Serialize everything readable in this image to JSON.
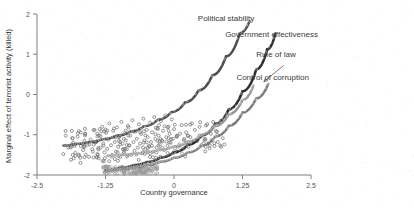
{
  "chart_data": {
    "type": "scatter",
    "title": "",
    "subtitle": "",
    "xlabel": "Country governance",
    "ylabel": "Marginal effect of terrorist activity (killed)",
    "xlim": [
      -2.5,
      2.5
    ],
    "ylim": [
      -2,
      2
    ],
    "xticks": [
      -2.5,
      -1.25,
      0,
      1.25,
      2.5
    ],
    "xticklabels": [
      "-2.5",
      "-1.25",
      "0",
      "1.25",
      "2.5"
    ],
    "yticks": [
      -2,
      -1,
      0,
      1,
      2
    ],
    "yticklabels": [
      "-2",
      "-1",
      "0",
      "1",
      "2"
    ],
    "grid": false,
    "legend_position": "annotations-right",
    "annotations": [
      {
        "text": "Political stability",
        "x": 0.95,
        "y": 1.82,
        "color": "#3a3a3a"
      },
      {
        "text": "Government effectiveness",
        "x": 1.78,
        "y": 1.42,
        "color": "#3a3a3a"
      },
      {
        "text": "Rule of law",
        "x": 1.86,
        "y": 0.92,
        "color": "#3a3a3a"
      },
      {
        "text": "Control of corruption",
        "x": 1.8,
        "y": 0.36,
        "color": "#3a3a3a"
      }
    ],
    "arrows": [
      {
        "from_x": 2.0,
        "from_y": 0.72,
        "to_x": 1.64,
        "to_y": 0.32
      }
    ],
    "series": [
      {
        "name": "Political stability",
        "type": "line",
        "color": "#404040",
        "marker": "circle-open",
        "x": [
          -2.02,
          -1.8,
          -1.55,
          -1.3,
          -1.05,
          -0.8,
          -0.55,
          -0.3,
          -0.05,
          0.2,
          0.45,
          0.7,
          0.95,
          1.2,
          1.38
        ],
        "y": [
          -1.27,
          -1.23,
          -1.18,
          -1.11,
          -1.02,
          -0.92,
          -0.79,
          -0.63,
          -0.44,
          -0.2,
          0.1,
          0.48,
          0.95,
          1.52,
          1.82
        ]
      },
      {
        "name": "Government effectiveness",
        "type": "line",
        "color": "#1c1c1c",
        "marker": "circle-open",
        "x": [
          -1.25,
          -1.0,
          -0.75,
          -0.5,
          -0.25,
          0.0,
          0.25,
          0.5,
          0.75,
          1.0,
          1.25,
          1.5,
          1.7,
          1.85
        ],
        "y": [
          -1.88,
          -1.83,
          -1.76,
          -1.68,
          -1.57,
          -1.43,
          -1.25,
          -1.02,
          -0.73,
          -0.37,
          0.08,
          0.62,
          1.12,
          1.52
        ]
      },
      {
        "name": "Rule of law",
        "type": "line",
        "color": "#8c8c8c",
        "marker": "circle-open",
        "x": [
          -1.22,
          -1.0,
          -0.75,
          -0.5,
          -0.25,
          0.0,
          0.25,
          0.5,
          0.75,
          1.0,
          1.25,
          1.45
        ],
        "y": [
          -1.52,
          -1.5,
          -1.47,
          -1.43,
          -1.37,
          -1.29,
          -1.17,
          -1.0,
          -0.78,
          -0.49,
          -0.14,
          0.22
        ]
      },
      {
        "name": "Control of corruption",
        "type": "line",
        "color": "#6e6e6e",
        "marker": "circle-open",
        "x": [
          -1.22,
          -1.0,
          -0.75,
          -0.5,
          -0.25,
          0.0,
          0.25,
          0.5,
          0.75,
          1.0,
          1.25,
          1.5,
          1.72
        ],
        "y": [
          -1.88,
          -1.85,
          -1.81,
          -1.75,
          -1.67,
          -1.57,
          -1.44,
          -1.27,
          -1.05,
          -0.78,
          -0.45,
          -0.1,
          0.26
        ]
      }
    ],
    "scatter": {
      "name": "observations",
      "marker": "circle-open",
      "color": "#6b6b6b",
      "n_points": 260,
      "x_range": [
        -2.05,
        0.95
      ],
      "y_range": [
        -1.95,
        -0.35
      ],
      "points": [
        [
          -2.02,
          -1.48
        ],
        [
          -1.93,
          -1.32
        ],
        [
          -1.88,
          -1.62
        ],
        [
          -1.84,
          -1.2
        ],
        [
          -1.8,
          -1.45
        ],
        [
          -1.76,
          -1.05
        ],
        [
          -1.73,
          -1.52
        ],
        [
          -1.7,
          -1.28
        ],
        [
          -1.66,
          -1.38
        ],
        [
          -1.62,
          -0.98
        ],
        [
          -1.58,
          -1.25
        ],
        [
          -1.55,
          -1.55
        ],
        [
          -1.52,
          -1.12
        ],
        [
          -1.48,
          -1.42
        ],
        [
          -1.45,
          -0.88
        ],
        [
          -1.42,
          -1.18
        ],
        [
          -1.4,
          -1.48
        ],
        [
          -1.37,
          -1.02
        ],
        [
          -1.34,
          -1.32
        ],
        [
          -1.31,
          -0.8
        ],
        [
          -1.29,
          -1.22
        ],
        [
          -1.26,
          -1.58
        ],
        [
          -1.24,
          -0.95
        ],
        [
          -1.22,
          -1.35
        ],
        [
          -1.2,
          -1.12
        ],
        [
          -1.18,
          -0.72
        ],
        [
          -1.15,
          -1.26
        ],
        [
          -1.13,
          -1.5
        ],
        [
          -1.11,
          -0.9
        ],
        [
          -1.08,
          -1.18
        ],
        [
          -1.06,
          -1.42
        ],
        [
          -1.04,
          -0.82
        ],
        [
          -1.02,
          -1.3
        ],
        [
          -1.0,
          -1.05
        ],
        [
          -0.98,
          -1.55
        ],
        [
          -0.96,
          -0.68
        ],
        [
          -0.94,
          -1.22
        ],
        [
          -0.92,
          -1.46
        ],
        [
          -0.9,
          -0.96
        ],
        [
          -0.88,
          -1.14
        ],
        [
          -0.86,
          -1.36
        ],
        [
          -0.84,
          -0.78
        ],
        [
          -0.82,
          -1.26
        ],
        [
          -0.8,
          -1.02
        ],
        [
          -0.78,
          -1.5
        ],
        [
          -0.76,
          -0.64
        ],
        [
          -0.74,
          -1.18
        ],
        [
          -0.72,
          -1.4
        ],
        [
          -0.7,
          -0.92
        ],
        [
          -0.68,
          -1.1
        ],
        [
          -0.66,
          -1.32
        ],
        [
          -0.64,
          -0.74
        ],
        [
          -0.62,
          -1.22
        ],
        [
          -0.6,
          -0.98
        ],
        [
          -0.58,
          -1.46
        ],
        [
          -0.56,
          -0.6
        ],
        [
          -0.54,
          -1.14
        ],
        [
          -0.52,
          -1.36
        ],
        [
          -0.5,
          -0.88
        ],
        [
          -0.48,
          -1.06
        ],
        [
          -0.46,
          -1.28
        ],
        [
          -0.44,
          -0.7
        ],
        [
          -0.42,
          -1.18
        ],
        [
          -0.4,
          -0.94
        ],
        [
          -0.38,
          -1.42
        ],
        [
          -0.36,
          -0.56
        ],
        [
          -0.34,
          -1.1
        ],
        [
          -0.32,
          -1.32
        ],
        [
          -0.3,
          -0.84
        ],
        [
          -0.28,
          -1.02
        ],
        [
          -0.26,
          -1.24
        ],
        [
          -0.24,
          -0.66
        ],
        [
          -0.22,
          -1.14
        ],
        [
          -0.2,
          -0.9
        ],
        [
          -0.18,
          -1.38
        ],
        [
          -0.16,
          -0.52
        ],
        [
          -0.14,
          -1.06
        ],
        [
          -0.12,
          -1.28
        ],
        [
          -0.1,
          -0.8
        ],
        [
          -0.08,
          -0.98
        ],
        [
          -0.06,
          -1.2
        ],
        [
          -0.04,
          -0.62
        ],
        [
          -0.02,
          -1.1
        ],
        [
          0.0,
          -0.86
        ],
        [
          0.02,
          -1.34
        ],
        [
          0.06,
          -1.02
        ],
        [
          0.1,
          -1.24
        ],
        [
          0.14,
          -0.76
        ],
        [
          0.18,
          -1.14
        ],
        [
          0.22,
          -0.94
        ],
        [
          0.26,
          -1.3
        ],
        [
          0.3,
          -1.06
        ],
        [
          0.34,
          -1.2
        ],
        [
          0.38,
          -0.88
        ],
        [
          0.42,
          -1.16
        ],
        [
          0.46,
          -1.02
        ],
        [
          0.5,
          -1.26
        ],
        [
          0.56,
          -1.1
        ],
        [
          0.62,
          -1.22
        ],
        [
          0.68,
          -1.14
        ],
        [
          0.74,
          -1.28
        ],
        [
          0.8,
          -1.18
        ],
        [
          0.86,
          -1.3
        ],
        [
          0.92,
          -1.24
        ]
      ],
      "dense_band": {
        "description": "dense low cluster along control-of-corruption curve",
        "x_range": [
          -1.3,
          -0.3
        ],
        "y_range": [
          -1.98,
          -1.78
        ]
      }
    }
  },
  "figure": {
    "background_color": "#ffffff",
    "axis_color": "#808080",
    "text_color": "#333333"
  }
}
